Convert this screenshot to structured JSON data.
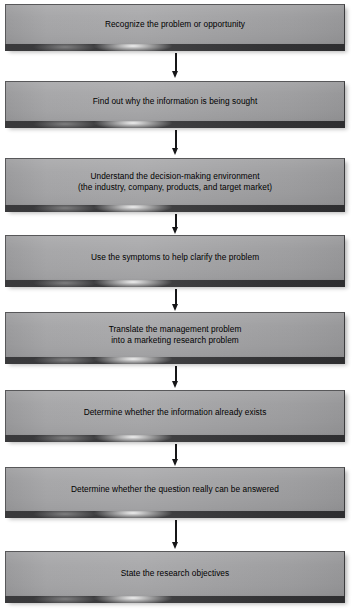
{
  "diagram": {
    "type": "flowchart",
    "orientation": "vertical",
    "title": "",
    "colors": {
      "box_fill": "#a6a6a8",
      "box_bevel": "#3a3a3c",
      "box_border": "#58585a",
      "arrow": "#161618",
      "text": "#000000",
      "background": "#ffffff"
    },
    "nodes": [
      {
        "id": "step-1",
        "text": "Recognize the problem or opportunity",
        "lines": 1,
        "top": 4,
        "height": 40
      },
      {
        "id": "step-2",
        "text": "Find out why the information is being sought",
        "lines": 1,
        "top": 81,
        "height": 40
      },
      {
        "id": "step-3",
        "text": "Understand the decision-making environment\n(the industry, company, products, and target market)",
        "lines": 2,
        "top": 158,
        "height": 47
      },
      {
        "id": "step-4",
        "text": "Use the symptoms to help clarify the problem",
        "lines": 1,
        "top": 235,
        "height": 45
      },
      {
        "id": "step-5",
        "text": "Translate the management problem\ninto a marketing research problem",
        "lines": 2,
        "top": 312,
        "height": 45
      },
      {
        "id": "step-6",
        "text": "Determine whether the information already exists",
        "lines": 1,
        "top": 390,
        "height": 45
      },
      {
        "id": "step-7",
        "text": "Determine whether the question really can be answered",
        "lines": 1,
        "top": 467,
        "height": 44
      },
      {
        "id": "step-8",
        "text": "State the research objectives",
        "lines": 1,
        "top": 551,
        "height": 45
      }
    ],
    "connectors": [
      {
        "id": "arrow-1-2",
        "from": "step-1",
        "to": "step-2",
        "top": 53,
        "length": 25
      },
      {
        "id": "arrow-2-3",
        "from": "step-2",
        "to": "step-3",
        "top": 130,
        "length": 25
      },
      {
        "id": "arrow-3-4",
        "from": "step-3",
        "to": "step-4",
        "top": 214,
        "length": 19
      },
      {
        "id": "arrow-4-5",
        "from": "step-4",
        "to": "step-5",
        "top": 289,
        "length": 21
      },
      {
        "id": "arrow-5-6",
        "from": "step-5",
        "to": "step-6",
        "top": 366,
        "length": 22
      },
      {
        "id": "arrow-6-7",
        "from": "step-6",
        "to": "step-7",
        "top": 444,
        "length": 22
      },
      {
        "id": "arrow-7-8",
        "from": "step-7",
        "to": "step-8",
        "top": 520,
        "length": 29
      }
    ]
  }
}
